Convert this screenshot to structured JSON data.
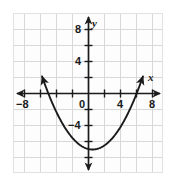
{
  "figure": {
    "width": 176,
    "height": 185,
    "background_color": "#ffffff",
    "plot_background_color": "#fdfdfd",
    "frame_color": "#e2e2e2"
  },
  "chart_data": {
    "type": "line",
    "title": "",
    "subtitle": "",
    "xlabel": "x",
    "ylabel": "y",
    "xlim": [
      -10,
      10
    ],
    "ylim": [
      -10,
      10
    ],
    "grid": true,
    "grid_step": 2,
    "grid_color": "#d8d8d8",
    "axis_color": "#1b1b1b",
    "curve_color": "#1b1b1b",
    "legend": null,
    "legend_position": "none",
    "xticks": [
      -8,
      -6,
      -4,
      -2,
      0,
      2,
      4,
      6,
      8
    ],
    "yticks": [
      -8,
      -6,
      -4,
      -2,
      0,
      2,
      4,
      6,
      8
    ],
    "xtick_labels_shown": [
      "-8",
      "0",
      "4",
      "8"
    ],
    "ytick_labels_shown": [
      "8",
      "4",
      "-4"
    ],
    "annotations": [],
    "series": [
      {
        "name": "parabola",
        "type": "quadratic",
        "equation_form": "y = a(x - h)^2 + k",
        "a": 0.23,
        "vertex": [
          0.5,
          -7.0
        ],
        "x_intercepts": [
          -5.0,
          6.0
        ],
        "y_intercept": -6.9,
        "arrow_start": true,
        "arrow_end": true,
        "x": [
          -5.8,
          -5.0,
          -4.0,
          -3.0,
          -2.0,
          -1.0,
          0.0,
          0.5,
          1.0,
          2.0,
          3.0,
          4.0,
          5.0,
          6.0,
          6.8
        ],
        "y": [
          8.5,
          5.0,
          1.6,
          -1.3,
          -3.5,
          -5.2,
          -6.9,
          -7.0,
          -6.9,
          -5.2,
          -3.5,
          -1.3,
          1.6,
          5.0,
          8.5
        ]
      }
    ]
  },
  "labels": {
    "x_axis_name": "x",
    "y_axis_name": "y",
    "x_neg8": "−8",
    "x_zero": "0",
    "x_4": "4",
    "x_8": "8",
    "y_8": "8",
    "y_4": "4",
    "y_neg4": "−4"
  }
}
